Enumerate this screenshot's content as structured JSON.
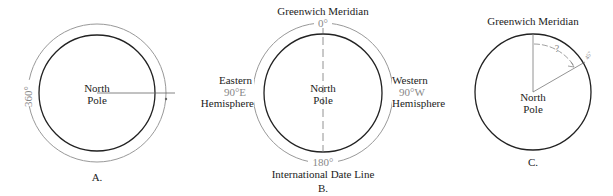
{
  "figures": [
    {
      "id": "A",
      "caption": "A.",
      "center_label": [
        "North",
        "Pole"
      ],
      "arc_label": "360°"
    },
    {
      "id": "B",
      "caption": "B.",
      "center_label": [
        "North",
        "Pole"
      ],
      "top_label": "Greenwich Meridian",
      "top_degree": "0°",
      "bottom_label": "International Date Line",
      "bottom_degree": "180°",
      "left_label": [
        "Eastern",
        "90°E",
        "Hemisphere"
      ],
      "right_label": [
        "Western",
        "90°W",
        "Hemisphere"
      ]
    },
    {
      "id": "C",
      "caption": "C.",
      "center_label": [
        "North",
        "Pole"
      ],
      "top_label": "Greenwich Meridian",
      "angle_label": "?",
      "edge_label": "45°"
    }
  ]
}
